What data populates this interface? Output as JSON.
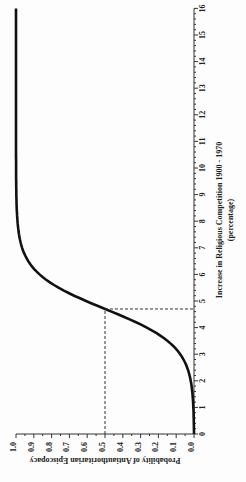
{
  "chart_data": {
    "type": "line",
    "title": "",
    "xlabel": "Increase in Religious Competition 1900 - 1970 (percentage)",
    "xlabel_line1": "Increase in Religious Competition 1900 - 1970",
    "xlabel_line2": "(percentage)",
    "ylabel": "Probability of Antiauthoritarian Episcopacy",
    "xlim": [
      0,
      16
    ],
    "ylim": [
      0.0,
      1.0
    ],
    "x_ticks": [
      "0",
      "1",
      "2",
      "3",
      "4",
      "5",
      "6",
      "7",
      "8",
      "9",
      "10",
      "11",
      "12",
      "13",
      "14",
      "15",
      "16"
    ],
    "y_ticks": [
      "0.0",
      "0.1",
      "0.2",
      "0.3",
      "0.4",
      "0.5",
      "0.6",
      "0.7",
      "0.8",
      "0.9",
      "1.0"
    ],
    "orientation": "rotated 90 degrees counter-clockwise",
    "grid": false,
    "series": [
      {
        "name": "logistic curve",
        "x": [
          0,
          1,
          2,
          3,
          4,
          4.7,
          5,
          6,
          7,
          8,
          9,
          10,
          12,
          16
        ],
        "y": [
          0.0,
          0.01,
          0.02,
          0.09,
          0.27,
          0.5,
          0.6,
          0.86,
          0.96,
          0.99,
          1.0,
          1.0,
          1.0,
          1.0
        ]
      }
    ],
    "annotations": [
      {
        "type": "dashed reference",
        "x": 4.7,
        "y": 0.5
      }
    ]
  }
}
